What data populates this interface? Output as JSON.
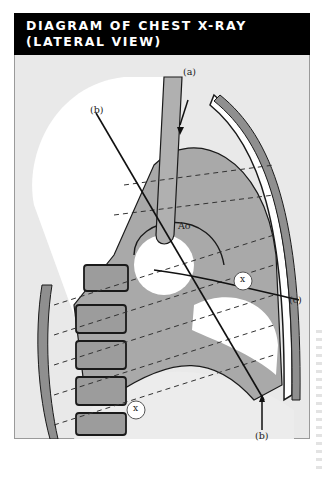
{
  "title": {
    "line1": "DIAGRAM OF CHEST X-RAY",
    "line2": "(LATERAL VIEW)"
  },
  "labels": {
    "a_top": "(a)",
    "b_top": "(b)",
    "c_right": "(c)",
    "b_bottom": "(b)",
    "aorta": "Ao",
    "x_upper": "x",
    "x_lower": "x"
  },
  "colors": {
    "title_bg": "#000000",
    "title_text": "#ffffff",
    "panel_bg": "#e9e9e9",
    "tissue_dark": "#9c9c9c",
    "tissue_mid": "#b8b8b8",
    "lung_white": "#ffffff",
    "outline": "#1a1a1a"
  }
}
